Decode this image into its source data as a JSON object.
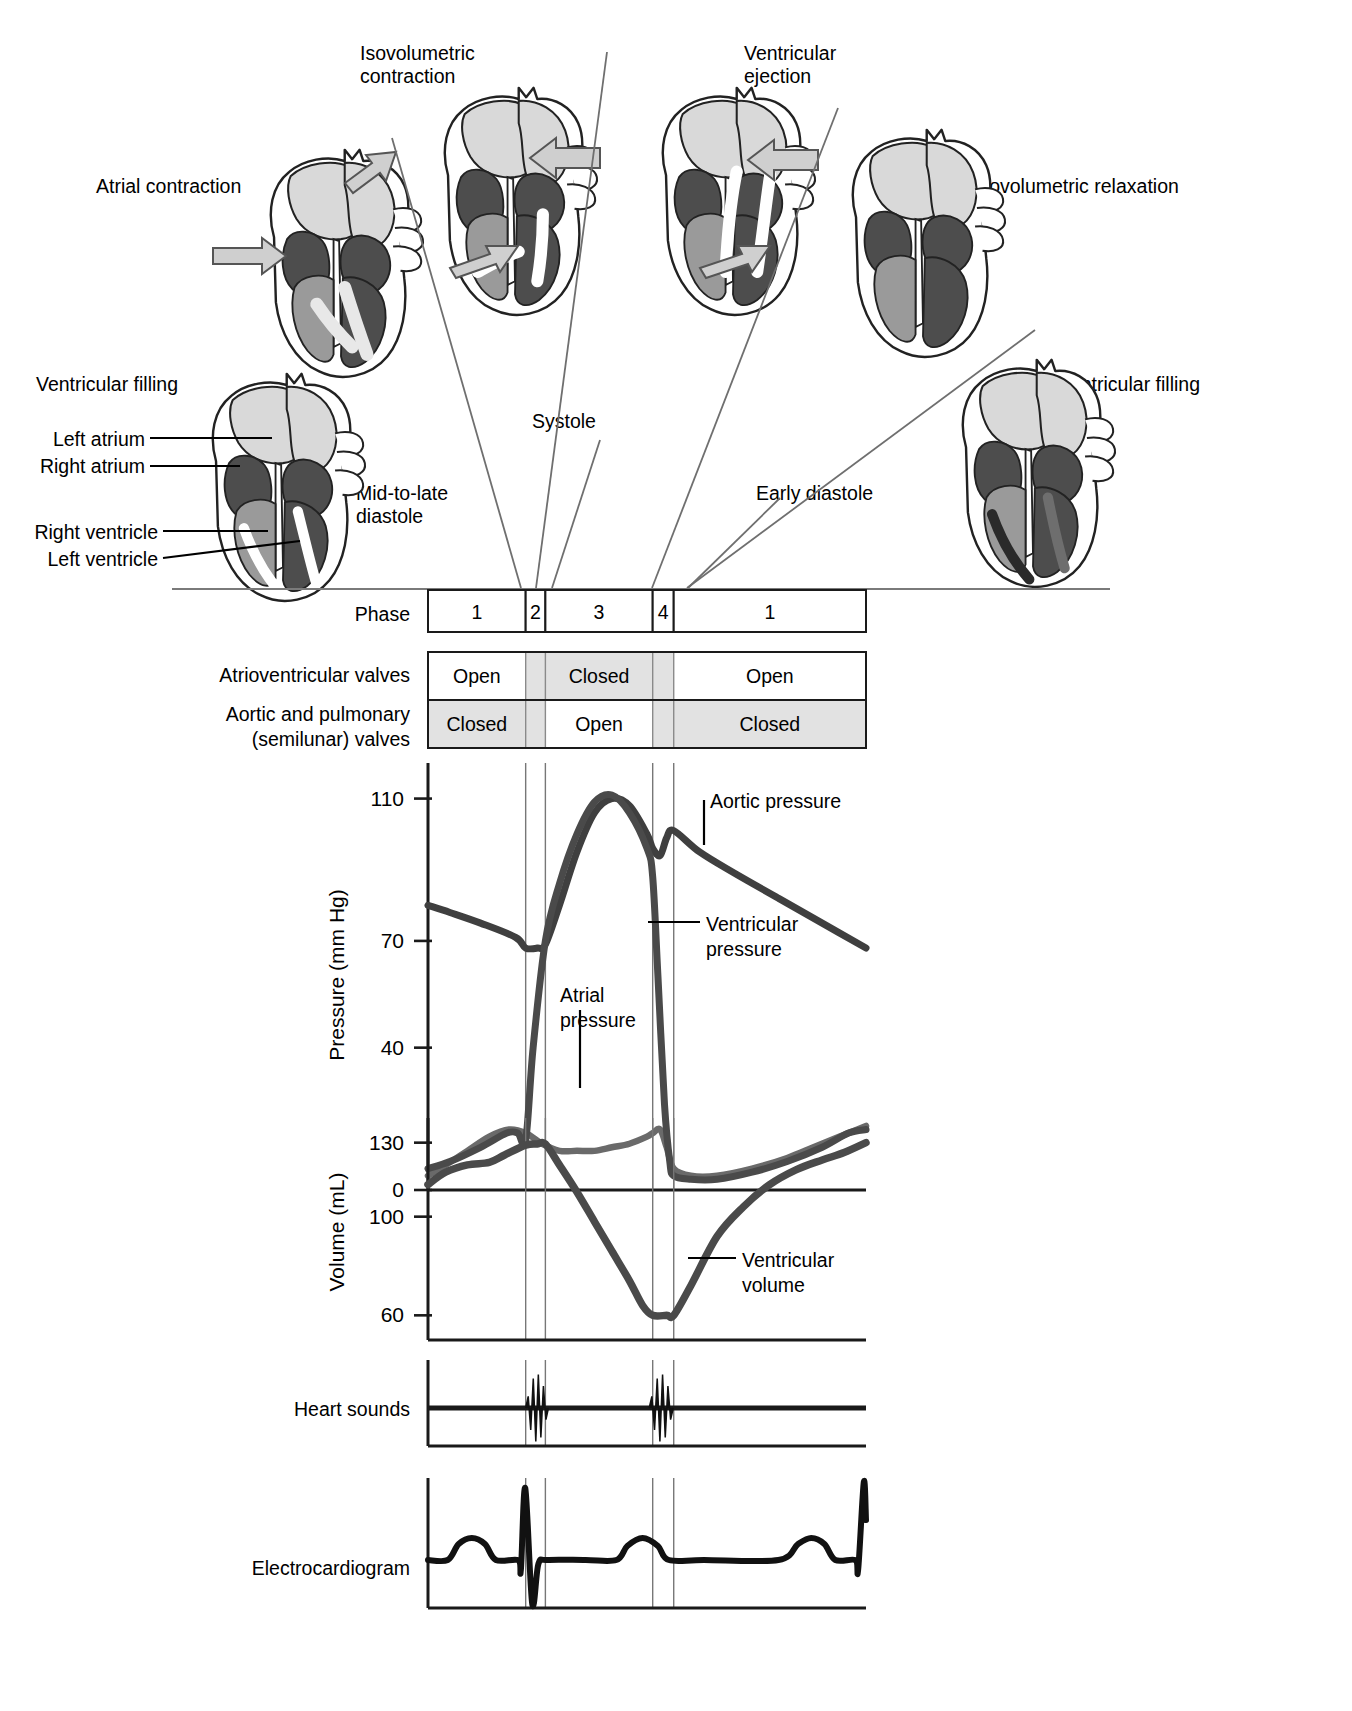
{
  "figure": {
    "phase_labels": {
      "atrial_contraction": "Atrial contraction",
      "isovolumetric_contraction": "Isovolumetric\ncontraction",
      "ventricular_ejection": "Ventricular\nejection",
      "isovolumetric_relaxation": "Isovolumetric relaxation",
      "ventricular_filling_left": "Ventricular filling",
      "ventricular_filling_right": "Ventricular filling",
      "systole": "Systole",
      "mid_to_late_diastole": "Mid-to-late\ndiastole",
      "early_diastole": "Early diastole"
    },
    "anatomy_callouts": [
      {
        "label": "Left atrium"
      },
      {
        "label": "Right atrium"
      },
      {
        "label": "Right ventricle"
      },
      {
        "label": "Left ventricle"
      }
    ]
  },
  "phase_row": {
    "row_label": "Phase",
    "cells": [
      {
        "label": "1",
        "x0": 0.0,
        "x1": 0.223
      },
      {
        "label": "2",
        "x0": 0.223,
        "x1": 0.268
      },
      {
        "label": "3",
        "x0": 0.268,
        "x1": 0.513
      },
      {
        "label": "4",
        "x0": 0.513,
        "x1": 0.561
      },
      {
        "label": "1",
        "x0": 0.561,
        "x1": 1.0
      }
    ]
  },
  "valve_rows": [
    {
      "row_label": "Atrioventricular valves",
      "segments": [
        {
          "state": "Open",
          "x0": 0.0,
          "x1": 0.223,
          "shaded": false
        },
        {
          "state": "",
          "x0": 0.223,
          "x1": 0.268,
          "shaded": true
        },
        {
          "state": "Closed",
          "x0": 0.268,
          "x1": 0.513,
          "shaded": true
        },
        {
          "state": "",
          "x0": 0.513,
          "x1": 0.561,
          "shaded": true
        },
        {
          "state": "Open",
          "x0": 0.561,
          "x1": 1.0,
          "shaded": false
        }
      ]
    },
    {
      "row_label": "Aortic and pulmonary\n(semilunar) valves",
      "segments": [
        {
          "state": "Closed",
          "x0": 0.0,
          "x1": 0.223,
          "shaded": true
        },
        {
          "state": "",
          "x0": 0.223,
          "x1": 0.268,
          "shaded": true
        },
        {
          "state": "Open",
          "x0": 0.268,
          "x1": 0.513,
          "shaded": false
        },
        {
          "state": "",
          "x0": 0.513,
          "x1": 0.561,
          "shaded": true
        },
        {
          "state": "Closed",
          "x0": 0.561,
          "x1": 1.0,
          "shaded": true
        }
      ]
    }
  ],
  "chart_data": [
    {
      "type": "line",
      "name": "pressure-panel",
      "ylabel": "Pressure (mm Hg)",
      "xlabel": "",
      "yticks": [
        0,
        40,
        70,
        110
      ],
      "ylim": [
        0,
        120
      ],
      "grid": false,
      "legend_position": "inline-annotations",
      "annotations": [
        {
          "text": "Aortic pressure",
          "x": 0.73,
          "y": 100
        },
        {
          "text": "Ventricular\npressure",
          "x": 0.63,
          "y": 55
        },
        {
          "text": "Atrial\npressure",
          "x": 0.4,
          "y": 33
        }
      ],
      "series": [
        {
          "name": "Aortic pressure",
          "color": "#3f3f3f",
          "x": [
            0.0,
            0.05,
            0.12,
            0.2,
            0.223,
            0.25,
            0.268,
            0.3,
            0.34,
            0.38,
            0.42,
            0.46,
            0.5,
            0.513,
            0.53,
            0.545,
            0.561,
            0.62,
            0.7,
            0.8,
            0.9,
            1.0
          ],
          "y": [
            80,
            78,
            75,
            71,
            68,
            68,
            69,
            80,
            95,
            106,
            110,
            108,
            100,
            96,
            94,
            99,
            101,
            95,
            89,
            82,
            75,
            68
          ]
        },
        {
          "name": "Ventricular pressure",
          "color": "#4a4a4a",
          "x": [
            0.0,
            0.05,
            0.12,
            0.18,
            0.205,
            0.223,
            0.24,
            0.268,
            0.3,
            0.34,
            0.38,
            0.42,
            0.46,
            0.5,
            0.513,
            0.525,
            0.54,
            0.552,
            0.561,
            0.6,
            0.66,
            0.74,
            0.82,
            0.9,
            0.96,
            1.0
          ],
          "y": [
            6,
            8,
            12,
            16,
            16,
            14,
            40,
            70,
            86,
            100,
            109,
            111,
            106,
            96,
            88,
            60,
            24,
            8,
            4,
            3,
            3,
            5,
            8,
            12,
            16,
            17
          ]
        },
        {
          "name": "Atrial pressure",
          "color": "#5a5a5a",
          "x": [
            0.0,
            0.04,
            0.09,
            0.14,
            0.185,
            0.223,
            0.26,
            0.3,
            0.34,
            0.38,
            0.42,
            0.46,
            0.5,
            0.513,
            0.53,
            0.545,
            0.561,
            0.6,
            0.66,
            0.74,
            0.82,
            0.88,
            0.94,
            1.0
          ],
          "y": [
            4,
            7,
            11,
            15,
            17,
            16,
            13,
            11,
            11,
            11,
            12,
            13,
            15,
            16,
            17,
            12,
            6,
            4,
            4,
            6,
            9,
            12,
            15,
            18
          ]
        }
      ]
    },
    {
      "type": "line",
      "name": "volume-panel",
      "ylabel": "Volume (mL)",
      "xlabel": "",
      "yticks": [
        60,
        100,
        130
      ],
      "ylim": [
        50,
        140
      ],
      "grid": false,
      "annotations": [
        {
          "text": "Ventricular\nvolume",
          "x": 0.68,
          "y": 78
        }
      ],
      "series": [
        {
          "name": "Ventricular volume",
          "color": "#4a4a4a",
          "x": [
            0.0,
            0.04,
            0.09,
            0.14,
            0.175,
            0.223,
            0.25,
            0.268,
            0.3,
            0.34,
            0.38,
            0.42,
            0.46,
            0.49,
            0.513,
            0.545,
            0.561,
            0.6,
            0.66,
            0.72,
            0.78,
            0.84,
            0.9,
            0.95,
            1.0
          ],
          "y": [
            113,
            118,
            121,
            122,
            125,
            129,
            129.5,
            129.5,
            121,
            110,
            98,
            86,
            74,
            64,
            60,
            60,
            60,
            72,
            92,
            104,
            113,
            119,
            123,
            126,
            130
          ]
        }
      ]
    },
    {
      "type": "line",
      "name": "heart-sounds-panel",
      "ylabel": "Heart sounds",
      "annotations": [],
      "series": [
        {
          "name": "Heart sounds",
          "color": "#1a1a1a",
          "events": [
            {
              "label": "S1",
              "x0": 0.223,
              "x1": 0.275
            },
            {
              "label": "S2",
              "x0": 0.505,
              "x1": 0.56
            }
          ]
        }
      ]
    },
    {
      "type": "line",
      "name": "electrocardiogram-panel",
      "ylabel": "Electrocardiogram",
      "annotations": [],
      "series": [
        {
          "name": "ECG",
          "color": "#1a1a1a",
          "waves": [
            "P",
            "QRS",
            "T",
            "P",
            "QRS"
          ]
        }
      ]
    }
  ],
  "panel_labels": {
    "pressure_y": "Pressure (mm Hg)",
    "volume_y": "Volume (mL)",
    "heart_sounds": "Heart sounds",
    "ecg": "Electrocardiogram"
  },
  "colors": {
    "ink": "#000000",
    "shade": "#e0e0e0",
    "curve_dark": "#4a4a4a",
    "curve_mid": "#5f5f5f",
    "heart_light": "#d9d9d9",
    "heart_mid": "#9a9a9a",
    "heart_dark": "#4d4d4d"
  }
}
